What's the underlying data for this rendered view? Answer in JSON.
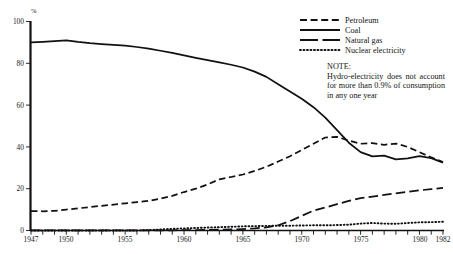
{
  "chart_data": {
    "type": "line",
    "title": "",
    "xlabel": "",
    "ylabel": "%",
    "xlim": [
      1947,
      1982
    ],
    "ylim": [
      0,
      100
    ],
    "grid": false,
    "legend_position": "top-right",
    "x_tick_labels": [
      "1947",
      "1950",
      "1955",
      "1960",
      "1965",
      "1970",
      "1975",
      "1980",
      "1982"
    ],
    "x_tick_values": [
      1947,
      1950,
      1955,
      1960,
      1965,
      1970,
      1975,
      1980,
      1982
    ],
    "y_tick_labels": [
      "0",
      "20",
      "40",
      "60",
      "80",
      "100"
    ],
    "y_tick_values": [
      0,
      20,
      40,
      60,
      80,
      100
    ],
    "minor_x_ticks_every": 1,
    "x": [
      1947,
      1948,
      1949,
      1950,
      1951,
      1952,
      1953,
      1954,
      1955,
      1956,
      1957,
      1958,
      1959,
      1960,
      1961,
      1962,
      1963,
      1964,
      1965,
      1966,
      1967,
      1968,
      1969,
      1970,
      1971,
      1972,
      1973,
      1974,
      1975,
      1976,
      1977,
      1978,
      1979,
      1980,
      1981,
      1982
    ],
    "series": [
      {
        "name": "Coal",
        "style": "solid",
        "values": [
          90.0,
          90.3,
          90.6,
          91.0,
          90.2,
          89.6,
          89.2,
          88.8,
          88.4,
          87.8,
          87.0,
          86.0,
          85.0,
          83.8,
          82.6,
          81.5,
          80.4,
          79.3,
          78.0,
          76.0,
          73.5,
          70.0,
          66.5,
          63.0,
          59.0,
          54.0,
          48.0,
          42.0,
          37.5,
          35.5,
          35.8,
          34.0,
          34.5,
          35.6,
          34.6,
          32.5
        ]
      },
      {
        "name": "Petroleum",
        "style": "dashed",
        "values": [
          9.3,
          9.2,
          9.4,
          10.0,
          10.6,
          11.2,
          11.8,
          12.4,
          13.0,
          13.6,
          14.2,
          15.2,
          16.6,
          18.4,
          20.0,
          22.0,
          24.5,
          25.6,
          26.8,
          28.5,
          30.5,
          33.0,
          35.5,
          38.5,
          41.5,
          44.5,
          44.8,
          43.0,
          41.5,
          41.8,
          41.0,
          41.6,
          40.0,
          37.5,
          35.0,
          32.8
        ]
      },
      {
        "name": "Natural gas",
        "style": "long-dashed",
        "values": [
          0.1,
          0.1,
          0.1,
          0.1,
          0.1,
          0.1,
          0.1,
          0.1,
          0.1,
          0.1,
          0.1,
          0.1,
          0.1,
          0.2,
          0.2,
          0.3,
          0.4,
          0.5,
          0.7,
          1.0,
          1.5,
          2.5,
          4.5,
          7.0,
          9.5,
          11.0,
          12.6,
          14.2,
          15.5,
          16.2,
          17.0,
          17.8,
          18.5,
          19.2,
          19.8,
          20.4
        ]
      },
      {
        "name": "Nuclear electricity",
        "style": "dotted",
        "values": [
          0.0,
          0.0,
          0.0,
          0.0,
          0.0,
          0.0,
          0.0,
          0.0,
          0.0,
          0.0,
          0.2,
          0.5,
          0.8,
          1.0,
          1.2,
          1.4,
          1.6,
          1.8,
          2.0,
          2.1,
          2.2,
          2.3,
          2.3,
          2.4,
          2.5,
          2.5,
          2.6,
          2.8,
          3.3,
          3.6,
          3.3,
          3.2,
          3.6,
          3.9,
          4.0,
          4.2
        ]
      }
    ],
    "note": {
      "title": "NOTE:",
      "body": "Hydro-electricity does not account for more than 0.9% of consumption in any one year"
    }
  },
  "legend": {
    "items": [
      {
        "label": "Petroleum"
      },
      {
        "label": "Coal"
      },
      {
        "label": "Natural gas"
      },
      {
        "label": "Nuclear electricity"
      }
    ]
  },
  "colors": {
    "ink": "#111111",
    "background": "#ffffff"
  }
}
